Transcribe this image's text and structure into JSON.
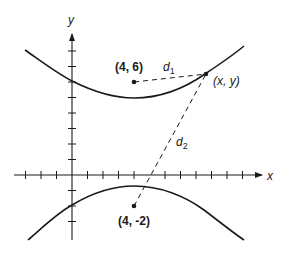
{
  "figure": {
    "axes": {
      "x_label": "x",
      "y_label": "y",
      "unit_px": 15.5,
      "origin_px": [
        72,
        175
      ],
      "x_ticks": [
        -3,
        -2,
        -1,
        1,
        2,
        3,
        4,
        5,
        6,
        7,
        8,
        9,
        10,
        11
      ],
      "y_ticks": [
        -3,
        -2,
        -1,
        1,
        2,
        3,
        4,
        5,
        6,
        7,
        8
      ]
    },
    "points": {
      "focus_upper": {
        "label": "(4, 6)",
        "coords": [
          4,
          6
        ]
      },
      "focus_lower": {
        "label": "(4, -2)",
        "coords": [
          4,
          -2
        ]
      },
      "curve_point": {
        "label": "(x, y)"
      }
    },
    "distances": {
      "d1": {
        "label": "d",
        "subscript": "1"
      },
      "d2": {
        "label": "d",
        "subscript": "2"
      }
    },
    "curve": {
      "type": "hyperbola",
      "branches": [
        "upper",
        "lower"
      ],
      "center": [
        4,
        2
      ]
    },
    "colors": {
      "ink": "#1a1a1a",
      "background": "#ffffff"
    }
  }
}
